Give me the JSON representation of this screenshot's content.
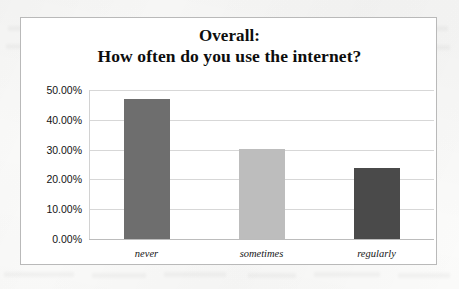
{
  "chart_data": {
    "type": "bar",
    "title": "Overall: How often do you use the internet?",
    "title_lines": [
      "Overall:",
      "How often do you use the internet?"
    ],
    "categories": [
      "never",
      "sometimes",
      "regularly"
    ],
    "values": [
      47.0,
      30.3,
      23.8
    ],
    "value_labels": [
      "47.00%",
      "30.30%",
      "23.80%"
    ],
    "xlabel": "",
    "ylabel": "",
    "ylim": [
      0,
      50
    ],
    "ytick_values": [
      0,
      10,
      20,
      30,
      40,
      50
    ],
    "ytick_labels": [
      "0.00%",
      "10.00%",
      "20.00%",
      "30.00%",
      "40.00%",
      "50.00%"
    ],
    "grid": true,
    "legend": false,
    "bar_colors": [
      "#6e6e6e",
      "#bdbdbd",
      "#4a4a4a"
    ]
  },
  "frame": {
    "border_color": "#b9b9b9",
    "background": "#ffffff"
  },
  "axis": {
    "gridline_color": "#d7d7d7",
    "baseline_color": "#bcbcbc"
  }
}
